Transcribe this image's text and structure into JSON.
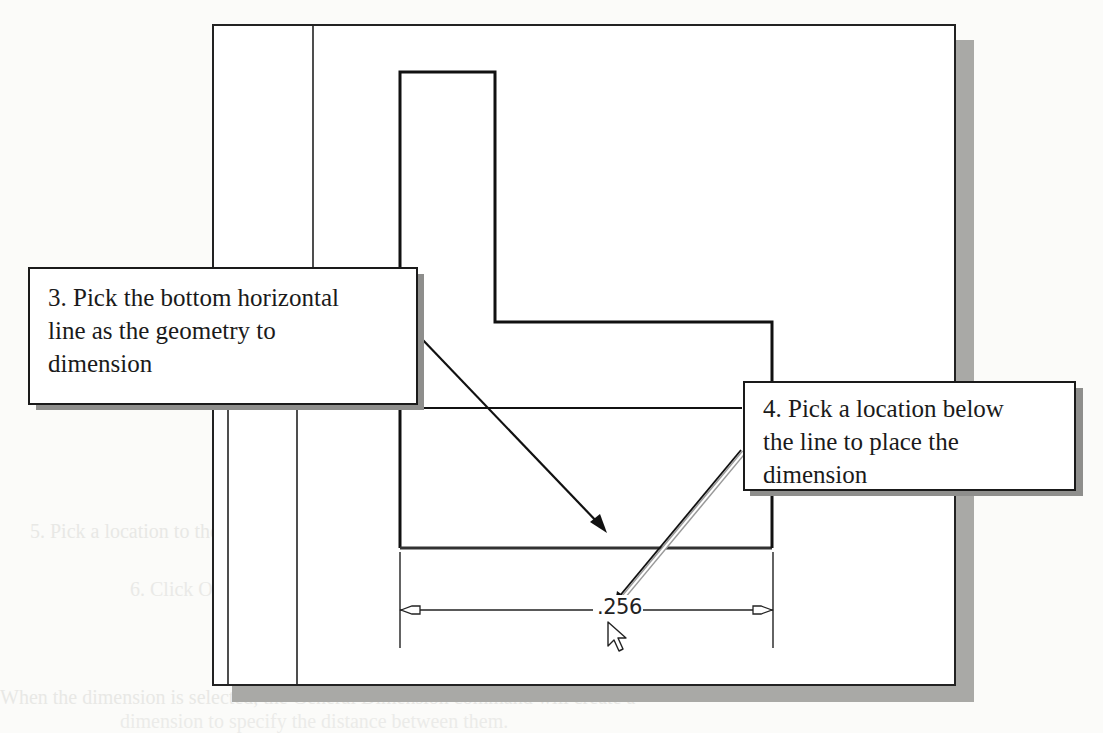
{
  "figure": {
    "type": "cad-dimension-tutorial",
    "callouts": [
      {
        "id": "step-3",
        "lines": [
          "3. Pick the bottom horizontal",
          "line as the geometry to",
          "dimension"
        ]
      },
      {
        "id": "step-4",
        "lines": [
          "4. Pick a location below",
          "the line to place the",
          "dimension"
        ]
      }
    ],
    "dimension": {
      "value": ".256",
      "orientation": "horizontal"
    },
    "cursor": "arrow-pointer",
    "colors": {
      "line": "#1a1a1a",
      "shadow": "#a9a9a6",
      "background": "#fbfbf9"
    }
  },
  "background_bleed": {
    "lines": [
      "5.  Pick a location to the left of the sketch to place the dimension",
      "6.  Click OK to accept the Accept button.",
      "When the dimension is selected, the General Dimension command will create a",
      "dimension to specify the distance between them."
    ]
  }
}
